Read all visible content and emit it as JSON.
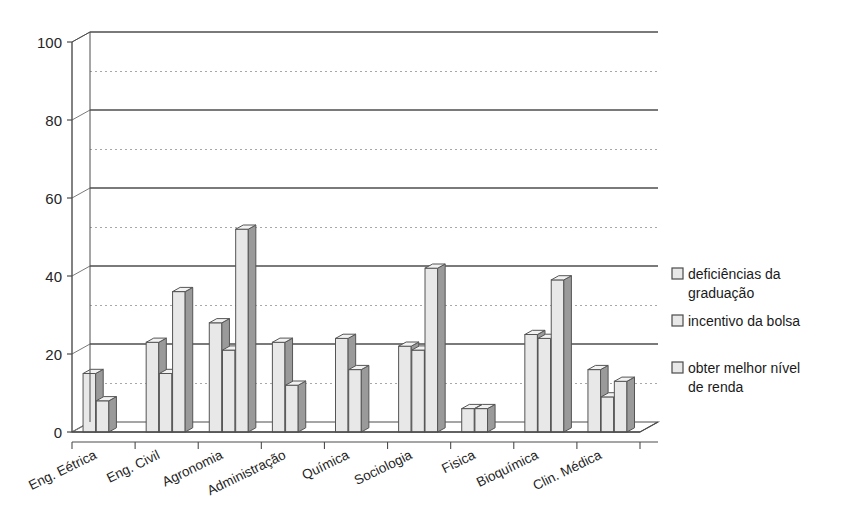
{
  "chart_data": {
    "type": "bar",
    "title": "",
    "subtitle": "",
    "xlabel": "",
    "ylabel": "",
    "ylim": [
      0,
      100
    ],
    "y_major_ticks": [
      0,
      20,
      40,
      60,
      80,
      100
    ],
    "y_minor_ticks": [
      10,
      30,
      50,
      70,
      90
    ],
    "grid": true,
    "grid_major_style": "solid",
    "grid_minor_style": "dotted",
    "legend_position": "right",
    "style": "3d-grouped-bars-grayscale",
    "categories": [
      "Eng. Eétrica",
      "Eng. Civil",
      "Agronomia",
      "Administração",
      "Química",
      "Sociologia",
      "Fisica",
      "Bioquímica",
      "Clin. Médica"
    ],
    "series": [
      {
        "name": "deficiências da graduação",
        "values": [
          15,
          23,
          28,
          23,
          24,
          22,
          6,
          25,
          16
        ]
      },
      {
        "name": "incentivo da bolsa",
        "values": [
          8,
          15,
          21,
          12,
          16,
          21,
          6,
          24,
          9
        ]
      },
      {
        "name": "obter melhor nível de renda",
        "values": [
          0,
          36,
          52,
          0,
          0,
          42,
          0,
          39,
          13
        ]
      }
    ],
    "axis_tick_labels": [
      "0",
      "20",
      "40",
      "60",
      "80",
      "100"
    ]
  },
  "legend": {
    "items": [
      {
        "label_line1": "deficiências da",
        "label_line2": "graduação"
      },
      {
        "label_line1": "incentivo da bolsa",
        "label_line2": ""
      },
      {
        "label_line1": "obter melhor nível",
        "label_line2": "de renda"
      }
    ]
  },
  "colors": {
    "bar_face": "#e8e8e8",
    "bar_side": "#9a9a9a",
    "bar_top": "#f2f2f2",
    "bar_stroke": "#555555",
    "axis": "#4d4d4d",
    "grid_major": "#7a7a7a",
    "grid_minor": "#a8a8a8",
    "background": "#ffffff",
    "text": "#1a1a1a"
  }
}
